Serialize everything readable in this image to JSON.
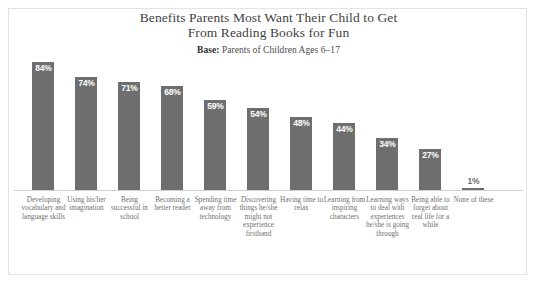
{
  "chart_data": {
    "type": "bar",
    "title": "Benefits Parents Most Want Their Child to Get From Reading Books for Fun",
    "title_lines": [
      "Benefits Parents Most Want Their Child to Get",
      "From Reading Books for Fun"
    ],
    "subtitle_lead": "Base:",
    "subtitle_rest": " Parents of Children Ages 6–17",
    "xlabel": "",
    "ylabel": "",
    "ylim": [
      0,
      100
    ],
    "grid": false,
    "legend": false,
    "value_suffix": "%",
    "bar_color": "#6e6e6e",
    "value_label_color_inside": "#ffffff",
    "value_label_color_outside": "#6b6b6b",
    "title_color": "#3f3f3f",
    "category_label_color": "#6f6f6f",
    "border_color": "#e3e3e3",
    "baseline_color": "#cfcfcf",
    "categories": [
      "Developing vocabulary and language skills",
      "Using his/her imagination",
      "Being successful in school",
      "Becoming a better reader",
      "Spending time away from technology",
      "Discovering things he/she might not experience firsthand",
      "Having time to relax",
      "Learning from inspiring characters",
      "Learning ways to deal with experiences he/she is going through",
      "Being able to forget about real life for a while",
      "None of these"
    ],
    "values": [
      84,
      74,
      71,
      68,
      59,
      54,
      48,
      44,
      34,
      27,
      1
    ],
    "value_labels": [
      "84%",
      "74%",
      "71%",
      "68%",
      "59%",
      "54%",
      "48%",
      "44%",
      "34%",
      "27%",
      "1%"
    ]
  }
}
